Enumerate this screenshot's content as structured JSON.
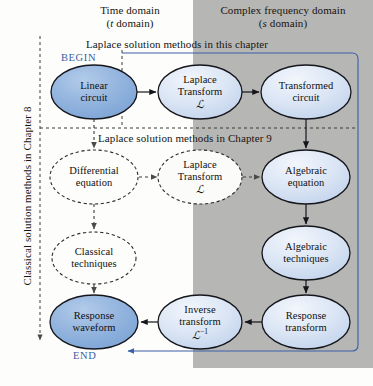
{
  "figure": {
    "headers": [
      {
        "line1": "Time domain",
        "line2_pre": "(",
        "line2_it": "t",
        "line2_post": " domain)"
      },
      {
        "line1": "Complex frequency domain",
        "line2_pre": "(",
        "line2_it": "s",
        "line2_post": " domain)"
      }
    ],
    "banners": [
      {
        "text": "Laplace solution methods in this chapter"
      },
      {
        "text": "Laplace solution methods in Chapter 9"
      }
    ],
    "side_label": "Classical solution methods in Chapter 8",
    "markers": {
      "begin": "BEGIN",
      "end": "END"
    },
    "nodes": [
      {
        "id": "linear-circuit",
        "line1": "Linear",
        "line2": "circuit",
        "line3": ""
      },
      {
        "id": "laplace-transform",
        "line1": "Laplace",
        "line2": "Transform",
        "line3": "L"
      },
      {
        "id": "transformed-circuit",
        "line1": "Transformed",
        "line2": "circuit",
        "line3": ""
      },
      {
        "id": "differential-equation",
        "line1": "Differential",
        "line2": "equation",
        "line3": ""
      },
      {
        "id": "laplace-transform-2",
        "line1": "Laplace",
        "line2": "Transform",
        "line3": "L"
      },
      {
        "id": "algebraic-equation",
        "line1": "Algebraic",
        "line2": "equation",
        "line3": ""
      },
      {
        "id": "classical-techniques",
        "line1": "Classical",
        "line2": "techniques",
        "line3": ""
      },
      {
        "id": "algebraic-techniques",
        "line1": "Algebraic",
        "line2": "techniques",
        "line3": ""
      },
      {
        "id": "response-waveform",
        "line1": "Response",
        "line2": "waveform",
        "line3": ""
      },
      {
        "id": "inverse-transform",
        "line1": "Inverse",
        "line2": "transform",
        "line3": "L-1"
      },
      {
        "id": "response-transform",
        "line1": "Response",
        "line2": "transform",
        "line3": ""
      }
    ],
    "colors": {
      "gray_panel": "#b6b6b4",
      "node_dark_blue": "#8fb2de",
      "node_light_blue": "#cfdcf0",
      "node_white": "#fdfdfb",
      "outline": "#15161c",
      "accent_blue": "#3a5fa8",
      "text": "#161412"
    }
  }
}
